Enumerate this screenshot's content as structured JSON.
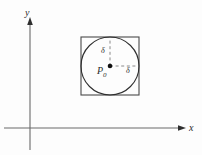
{
  "figure": {
    "background_color": "#fdfdfd",
    "stroke_color": "#3a3a3a",
    "axis_color": "#555555",
    "dash_color": "#777777",
    "labels": {
      "y_axis": "y",
      "x_axis": "x",
      "center_point": "P",
      "center_point_subscript": "0",
      "delta_vertical": "δ",
      "delta_horizontal": "δ"
    },
    "geometry": {
      "x_axis_y": 128,
      "y_axis_x": 30,
      "y_axis_top": 18,
      "y_axis_bottom": 150,
      "x_axis_left": 4,
      "x_axis_right": 186,
      "square_left": 81,
      "square_top": 37,
      "square_size": 58,
      "circle_center_x": 110,
      "circle_center_y": 66,
      "circle_radius": 29
    }
  }
}
